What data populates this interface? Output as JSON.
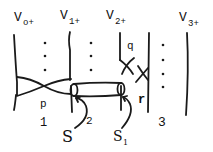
{
  "diagram": {
    "type": "braid/strand diagram",
    "strands": [
      {
        "label": "V",
        "sub": "o+"
      },
      {
        "label": "V",
        "sub": "1+"
      },
      {
        "label": "V",
        "sub": "2+"
      },
      {
        "label": "V",
        "sub": "3+"
      }
    ],
    "crossing_labels": {
      "p": "p",
      "q": "q",
      "r": "r"
    },
    "region_numbers": {
      "one": "1",
      "two": "2",
      "three": "3"
    },
    "surface_labels": {
      "s": "S",
      "s1_main": "S",
      "s1_sub": "1"
    },
    "colors": {
      "ink": "#1a1a1a",
      "background": "#ffffff"
    }
  }
}
